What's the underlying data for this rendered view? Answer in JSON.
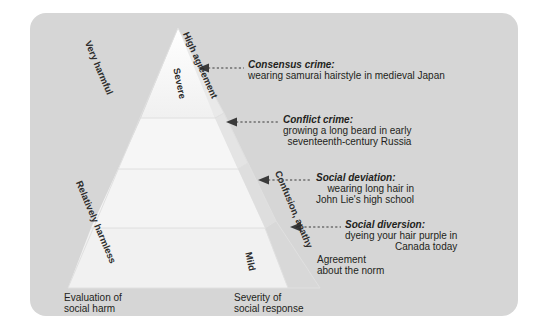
{
  "figure": {
    "type": "pyramid-diagram",
    "background_panel_color": "#d6d6d6",
    "pyramid_face_color": "#f7f7f7",
    "pyramid_side_color": "#e3e3e3",
    "text_color": "#231f20"
  },
  "edge_labels": {
    "left_top": "Very harmful",
    "left_bottom": "Relatively harmless",
    "right_top": "High agreement",
    "right_bottom": "Confusion, apathy",
    "inner_top": "Severe",
    "inner_bottom": "Mild"
  },
  "axis_labels": {
    "left": {
      "line1": "Evaluation of",
      "line2": "social harm"
    },
    "center": {
      "line1": "Severity of",
      "line2": "social response"
    },
    "right": {
      "line1": "Agreement",
      "line2": "about the norm"
    }
  },
  "callouts": [
    {
      "title": "Consensus crime:",
      "lines": [
        "wearing samurai hairstyle in medieval Japan"
      ]
    },
    {
      "title": "Conflict crime:",
      "lines": [
        "growing a long beard in early",
        "seventeenth-century Russia"
      ]
    },
    {
      "title": "Social deviation:",
      "lines": [
        "wearing long hair in",
        "John Lie's high school"
      ]
    },
    {
      "title": "Social diversion:",
      "lines": [
        "dyeing your hair purple in",
        "Canada today"
      ]
    }
  ]
}
